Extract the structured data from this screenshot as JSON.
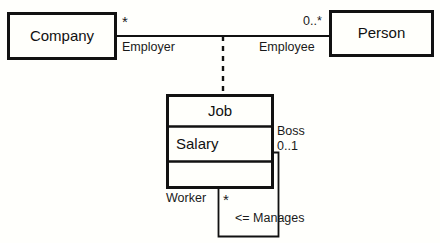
{
  "diagram": {
    "kind": "uml-class-diagram",
    "colors": {
      "background": "#fffffc",
      "stroke": "#111111",
      "text": "#111111",
      "box_fill": "#fffffb"
    },
    "classes": [
      {
        "id": "company",
        "name": "Company",
        "compartments": []
      },
      {
        "id": "person",
        "name": "Person",
        "compartments": []
      },
      {
        "id": "job",
        "name": "Job",
        "compartments": [
          "Salary",
          ""
        ]
      }
    ],
    "associations": [
      {
        "id": "employment",
        "source": "company",
        "target": "person",
        "source_role": "Employer",
        "source_multiplicity": "*",
        "target_role": "Employee",
        "target_multiplicity": "0..*",
        "association_class": "job",
        "link_style": "dashed"
      },
      {
        "id": "manages",
        "source": "job",
        "target": "job",
        "source_role": "Worker",
        "source_multiplicity": "*",
        "target_role": "Boss",
        "target_multiplicity": "0..1",
        "label": "<= Manages",
        "link_style": "solid",
        "reflexive": true
      }
    ]
  }
}
